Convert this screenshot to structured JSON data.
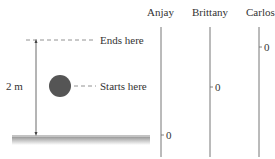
{
  "diagram": {
    "height_label": "2 m",
    "ends_label": "Ends here",
    "starts_label": "Starts here",
    "ball_color": "#555555",
    "ground_color": "#bfbfbf"
  },
  "axes": [
    {
      "name": "Anjay",
      "zero_label": "0"
    },
    {
      "name": "Brittany",
      "zero_label": "0"
    },
    {
      "name": "Carlos",
      "zero_label": "0"
    }
  ]
}
